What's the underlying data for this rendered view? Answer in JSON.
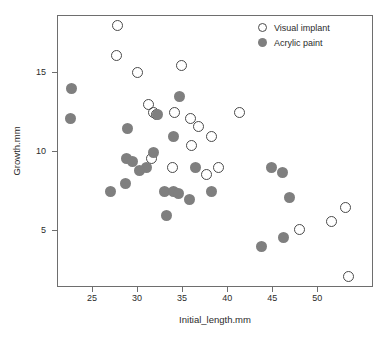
{
  "chart_data": {
    "type": "scatter",
    "title": "",
    "xlabel": "Initial_length.mm",
    "ylabel": "Growth.mm",
    "xlim": [
      21.1,
      56.2
    ],
    "ylim": [
      1.4,
      18.6
    ],
    "xticks": [
      25,
      30,
      35,
      40,
      45,
      50
    ],
    "yticks": [
      5,
      10,
      15
    ],
    "grid": false,
    "legend_position": "top-right",
    "colors": {
      "open_marker": "#4a4a4a",
      "filled_marker": "#7f7f7f",
      "axis": "#6e6e6e",
      "text": "#2b2b2b"
    },
    "series": [
      {
        "name": "Visual implant",
        "marker": "open-circle",
        "points": [
          [
            27.7,
            18.0
          ],
          [
            27.6,
            16.1
          ],
          [
            29.9,
            15.0
          ],
          [
            34.8,
            15.5
          ],
          [
            31.1,
            13.0
          ],
          [
            31.7,
            12.5
          ],
          [
            32.0,
            12.4
          ],
          [
            34.0,
            12.5
          ],
          [
            41.3,
            12.5
          ],
          [
            35.8,
            12.1
          ],
          [
            36.7,
            11.6
          ],
          [
            38.1,
            11.0
          ],
          [
            35.9,
            10.4
          ],
          [
            31.5,
            9.6
          ],
          [
            33.8,
            9.0
          ],
          [
            38.9,
            9.0
          ],
          [
            37.6,
            8.6
          ],
          [
            47.9,
            5.1
          ],
          [
            51.5,
            5.6
          ],
          [
            53.0,
            6.5
          ],
          [
            53.4,
            2.1
          ]
        ]
      },
      {
        "name": "Acrylic paint",
        "marker": "filled-circle",
        "points": [
          [
            22.6,
            14.0
          ],
          [
            22.5,
            12.1
          ],
          [
            28.8,
            11.5
          ],
          [
            34.6,
            13.5
          ],
          [
            32.2,
            12.4
          ],
          [
            33.9,
            11.0
          ],
          [
            31.7,
            10.0
          ],
          [
            28.7,
            9.6
          ],
          [
            29.4,
            9.4
          ],
          [
            30.9,
            9.0
          ],
          [
            30.2,
            8.8
          ],
          [
            28.6,
            8.0
          ],
          [
            26.9,
            7.5
          ],
          [
            32.9,
            7.5
          ],
          [
            33.9,
            7.5
          ],
          [
            34.5,
            7.4
          ],
          [
            35.7,
            7.0
          ],
          [
            38.2,
            7.5
          ],
          [
            36.4,
            9.0
          ],
          [
            33.1,
            6.0
          ],
          [
            44.8,
            9.0
          ],
          [
            46.0,
            8.7
          ],
          [
            46.8,
            7.1
          ],
          [
            46.1,
            4.6
          ],
          [
            43.7,
            4.0
          ]
        ]
      }
    ]
  },
  "legend": {
    "items": [
      {
        "label": "Visual implant",
        "marker": "open-circle"
      },
      {
        "label": "Acrylic paint",
        "marker": "filled-circle"
      }
    ]
  }
}
